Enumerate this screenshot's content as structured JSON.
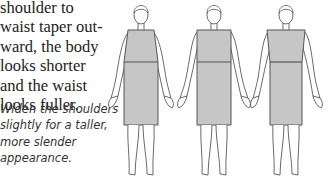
{
  "body_text": {
    "lines": [
      "shoulder to",
      "waist taper out-",
      "ward, the body",
      "looks shorter",
      "and the waist",
      "looks fuller."
    ]
  },
  "caption": {
    "lines": [
      "Widen the shoulders",
      "slightly for a taller,",
      "more slender",
      "appearance."
    ]
  },
  "figures": [
    {
      "name": "figure-taper-outward",
      "description": "shoulders narrower than waist"
    },
    {
      "name": "figure-straight",
      "description": "shoulders equal to waist"
    },
    {
      "name": "figure-widened-shoulders",
      "description": "shoulders wider than waist"
    }
  ],
  "colors": {
    "garment_fill": "#c6c6c6",
    "outline": "#555555"
  }
}
